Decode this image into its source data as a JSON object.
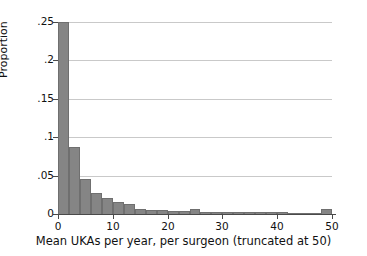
{
  "chart_data": {
    "type": "bar",
    "title": "",
    "subtitle": "",
    "xlabel": "Mean UKAs per year, per surgeon (truncated at 50)",
    "ylabel": "Proportion",
    "xlim": [
      0,
      50
    ],
    "ylim": [
      0,
      0.25
    ],
    "grid": "horizontal",
    "legend": "none",
    "bin_width": 2,
    "note": "First bar is clipped by the top of the plot region (extends beyond .25).",
    "xticks": [
      0,
      10,
      20,
      30,
      40,
      50
    ],
    "xtick_labels": [
      "0",
      "10",
      "20",
      "30",
      "40",
      "50"
    ],
    "yticks": [
      0,
      0.05,
      0.1,
      0.15,
      0.2,
      0.25
    ],
    "ytick_labels": [
      "0",
      ".05",
      ".1",
      ".15",
      ".2",
      ".25"
    ],
    "bar_color": "#858585",
    "bar_edge_color": "#6f6f6f",
    "grid_color": "#c9c9c9",
    "axis_color": "#4a4a4a",
    "categories": [
      1,
      3,
      5,
      7,
      9,
      11,
      13,
      15,
      17,
      19,
      21,
      23,
      25,
      27,
      29,
      31,
      33,
      35,
      37,
      39,
      41,
      43,
      45,
      47,
      49
    ],
    "bin_starts": [
      0,
      2,
      4,
      6,
      8,
      10,
      12,
      14,
      16,
      18,
      20,
      22,
      24,
      26,
      28,
      30,
      32,
      34,
      36,
      38,
      40,
      42,
      44,
      46,
      48
    ],
    "values": [
      0.252,
      0.087,
      0.046,
      0.027,
      0.021,
      0.016,
      0.013,
      0.006,
      0.005,
      0.005,
      0.004,
      0.004,
      0.006,
      0.002,
      0.002,
      0.002,
      0.002,
      0.002,
      0.003,
      0.002,
      0.002,
      0.0015,
      0.001,
      0.001,
      0.006
    ]
  }
}
